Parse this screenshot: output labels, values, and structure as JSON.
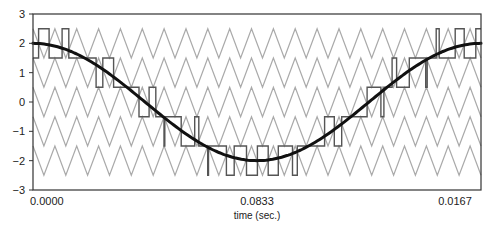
{
  "chart_data": {
    "type": "line",
    "title": "",
    "xlabel": "time (sec.)",
    "ylabel": "",
    "xlim": [
      0,
      0.0167
    ],
    "ylim": [
      -3,
      3
    ],
    "x_ticks": [
      {
        "value": 0.0,
        "label": "0.0000"
      },
      {
        "value": 0.00833,
        "label": "0.0833"
      },
      {
        "value": 0.0167,
        "label": "0.0167"
      }
    ],
    "y_ticks": [
      3,
      2,
      1,
      0,
      -1,
      -2,
      -3
    ],
    "y_tick_labels": [
      "3",
      "2",
      "1",
      "0",
      "−1",
      "−2",
      "−3"
    ],
    "grid": false,
    "legend": null,
    "series": [
      {
        "name": "reference sinusoid",
        "kind": "cosine",
        "amplitude": 2.0,
        "periods": 1,
        "color": "#111111",
        "line_width": 3
      },
      {
        "name": "triangular carriers",
        "kind": "triangle-bands",
        "bands": [
          [
            1.5,
            2.5
          ],
          [
            0.5,
            1.5
          ],
          [
            -0.5,
            0.5
          ],
          [
            -1.5,
            -0.5
          ],
          [
            -2.5,
            -1.5
          ]
        ],
        "periods": 20.5,
        "color": "#aaaaaa",
        "line_width": 1.2
      },
      {
        "name": "multilevel PWM output",
        "kind": "staircase",
        "color": "#555555",
        "line_width": 1.4,
        "levels": [
          2.5,
          1.5,
          0.5,
          -0.5,
          -1.5,
          -2.5
        ],
        "note": "stepped waveform switching between adjacent half-levels following the sinusoid"
      }
    ]
  },
  "axes": {
    "x_tick_labels": [
      "0.0000",
      "0.0833",
      "0.0167"
    ],
    "x_title": "time (sec.)",
    "y_tick_labels": [
      "3",
      "2",
      "1",
      "0",
      "−1",
      "−2",
      "−3"
    ]
  },
  "colors": {
    "frame": "#333333",
    "reference": "#111111",
    "carrier": "#aaaaaa",
    "pwm": "#555555",
    "text": "#222222"
  }
}
